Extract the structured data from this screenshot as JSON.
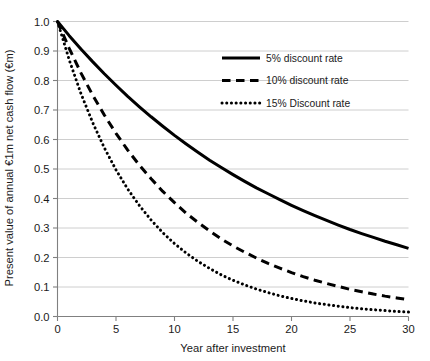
{
  "chart_data": {
    "type": "line",
    "title": "",
    "xlabel": "Year after investment",
    "ylabel": "Present value of annual €1m net cash flow (€m)",
    "xlim": [
      0,
      30
    ],
    "ylim": [
      0.0,
      1.0
    ],
    "grid": "horizontal",
    "legend_position": "top-right-inside",
    "xticks": [
      "0",
      "5",
      "10",
      "15",
      "20",
      "25",
      "30"
    ],
    "xtick_values": [
      0,
      5,
      10,
      15,
      20,
      25,
      30
    ],
    "yticks": [
      "0.0",
      "0.1",
      "0.2",
      "0.3",
      "0.4",
      "0.5",
      "0.6",
      "0.7",
      "0.8",
      "0.9",
      "1.0"
    ],
    "ytick_values": [
      0.0,
      0.1,
      0.2,
      0.3,
      0.4,
      0.5,
      0.6,
      0.7,
      0.8,
      0.9,
      1.0
    ],
    "x": [
      0,
      1,
      2,
      3,
      4,
      5,
      6,
      7,
      8,
      9,
      10,
      11,
      12,
      13,
      14,
      15,
      16,
      17,
      18,
      19,
      20,
      21,
      22,
      23,
      24,
      25,
      26,
      27,
      28,
      29,
      30
    ],
    "series": [
      {
        "name": "5% discount rate",
        "rate": 0.05,
        "style": "solid",
        "color": "#000000",
        "width": 3.0,
        "values": [
          1.0,
          0.952,
          0.907,
          0.864,
          0.823,
          0.784,
          0.746,
          0.711,
          0.677,
          0.645,
          0.614,
          0.585,
          0.557,
          0.53,
          0.505,
          0.481,
          0.458,
          0.436,
          0.416,
          0.396,
          0.377,
          0.359,
          0.342,
          0.326,
          0.31,
          0.295,
          0.281,
          0.268,
          0.255,
          0.243,
          0.231
        ]
      },
      {
        "name": "10% discount rate",
        "rate": 0.1,
        "style": "dashed",
        "color": "#000000",
        "width": 3.0,
        "values": [
          1.0,
          0.909,
          0.826,
          0.751,
          0.683,
          0.621,
          0.564,
          0.513,
          0.467,
          0.424,
          0.386,
          0.35,
          0.319,
          0.29,
          0.263,
          0.239,
          0.218,
          0.198,
          0.18,
          0.164,
          0.149,
          0.135,
          0.123,
          0.112,
          0.102,
          0.092,
          0.084,
          0.076,
          0.069,
          0.063,
          0.057
        ]
      },
      {
        "name": "15% Discount rate",
        "rate": 0.15,
        "style": "dotted",
        "color": "#000000",
        "width": 3.0,
        "values": [
          1.0,
          0.87,
          0.756,
          0.658,
          0.572,
          0.497,
          0.432,
          0.376,
          0.327,
          0.284,
          0.247,
          0.215,
          0.187,
          0.163,
          0.141,
          0.123,
          0.107,
          0.093,
          0.081,
          0.07,
          0.061,
          0.053,
          0.046,
          0.04,
          0.035,
          0.03,
          0.026,
          0.023,
          0.02,
          0.017,
          0.015
        ]
      }
    ],
    "colors": {
      "line": "#000000",
      "grid": "#c8c8c8",
      "axis": "#808080",
      "text": "#1a1a1a",
      "background": "#ffffff"
    }
  }
}
